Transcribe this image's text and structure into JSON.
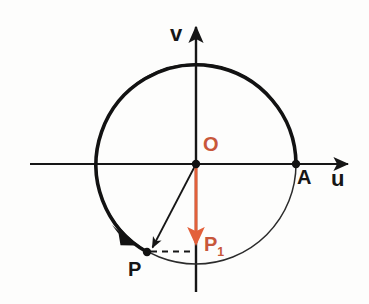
{
  "figure": {
    "background_color": "#fdfdfc",
    "stroke_color": "#161616",
    "accent_color": "#e3603a",
    "accent_label_color": "#c8573a"
  },
  "axes": {
    "horizontal": {
      "label": "u",
      "arrow_tip_x": 352,
      "start_x": 30,
      "y": 164
    },
    "vertical": {
      "label": "v",
      "arrow_tip_y": 22,
      "end_y": 292,
      "x": 196
    }
  },
  "circle": {
    "center": {
      "x": 196,
      "y": 164
    },
    "radius": 100,
    "thick_arc_label": "traversed-arc",
    "thin_arc_label": "remaining-arc"
  },
  "points": [
    {
      "name": "O",
      "label": "O",
      "x": 196,
      "y": 164,
      "color": "#c8573a",
      "kind": "origin"
    },
    {
      "name": "A",
      "label": "A",
      "x": 296,
      "y": 164,
      "color": "#161616",
      "kind": "reference"
    },
    {
      "name": "P",
      "label": "P",
      "x": 147,
      "y": 252,
      "color": "#161616",
      "kind": "moving"
    },
    {
      "name": "P1",
      "label": "P",
      "sublabel": "1",
      "x": 196,
      "y": 252,
      "color": "#c8573a",
      "kind": "projection"
    }
  ],
  "vectors": {
    "radius_vector": {
      "from": "O",
      "to": "P",
      "color": "#161616"
    },
    "projection_vector": {
      "from": "O",
      "to": "P1",
      "color": "#e3603a"
    }
  },
  "dashed_line": {
    "from_x": 150,
    "to_x": 194,
    "y": 251,
    "color": "#161616"
  },
  "arc_arrow": {
    "at_x": 122,
    "at_y": 233,
    "direction": "clockwise-descending-left-arc"
  }
}
